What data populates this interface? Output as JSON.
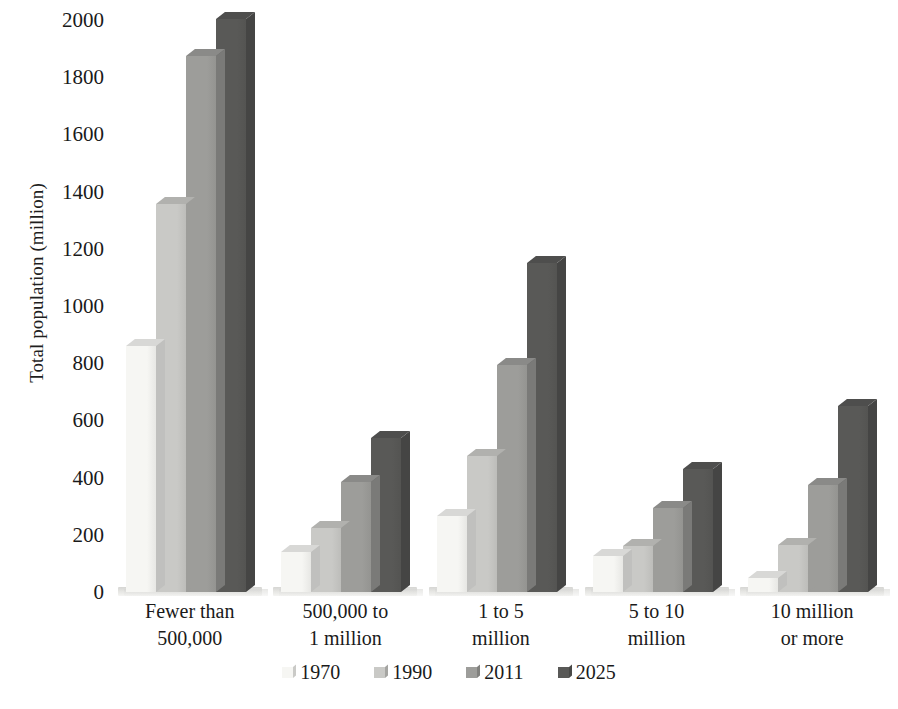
{
  "chart_data": {
    "type": "bar",
    "title": "",
    "xlabel": "",
    "ylabel": "Total population (million)",
    "ylim": [
      0,
      2000
    ],
    "ytick_step": 200,
    "yticks": [
      "2000",
      "1800",
      "1600",
      "1400",
      "1200",
      "1000",
      "800",
      "600",
      "400",
      "200",
      "0"
    ],
    "grid": false,
    "legend_position": "bottom",
    "categories": [
      "Fewer than 500,000",
      "500,000 to 1 million",
      "1 to 5 million",
      "5 to 10 million",
      "10 million or more"
    ],
    "category_lines": [
      [
        "Fewer than",
        "500,000"
      ],
      [
        "500,000 to",
        "1 million"
      ],
      [
        "1 to 5",
        "million"
      ],
      [
        "5 to 10",
        "million"
      ],
      [
        "10 million",
        "or more"
      ]
    ],
    "series": [
      {
        "name": "1970",
        "color": "#f6f6f3",
        "values": [
          860,
          140,
          265,
          125,
          50
        ]
      },
      {
        "name": "1990",
        "color": "#c9c9c6",
        "values": [
          1355,
          225,
          475,
          160,
          165
        ]
      },
      {
        "name": "2011",
        "color": "#9d9d9a",
        "values": [
          1875,
          385,
          795,
          295,
          375
        ]
      },
      {
        "name": "2025",
        "color": "#595957",
        "values": [
          2005,
          540,
          1150,
          430,
          650
        ]
      }
    ]
  },
  "legend": {
    "items": [
      {
        "label": "1970",
        "swatch_name": "legend-swatch-1970"
      },
      {
        "label": "1990",
        "swatch_name": "legend-swatch-1990"
      },
      {
        "label": "2011",
        "swatch_name": "legend-swatch-2011"
      },
      {
        "label": "2025",
        "swatch_name": "legend-swatch-2025"
      }
    ]
  }
}
